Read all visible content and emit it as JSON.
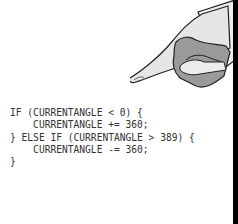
{
  "illustration": {
    "icon": "pointing-hand-icon",
    "fill_color": "#e8e8e8",
    "shadow_color": "#9a9a9a",
    "outline_color": "#222222"
  },
  "code": {
    "lines": [
      "IF (CURRENTANGLE < 0) {",
      "    CURRENTANGLE += 360;",
      "} ELSE IF (CURRENTANGLE > 389) {",
      "    CURRENTANGLE -= 360;",
      "}"
    ],
    "text_color": "#333333"
  },
  "panel": {
    "border_color": "#000000"
  }
}
